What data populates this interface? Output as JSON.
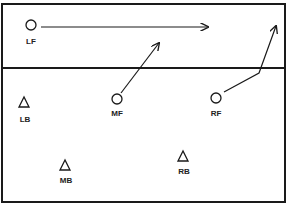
{
  "diagram": {
    "title": "",
    "colors": {
      "ink": "#1a1a1a",
      "background": "#ffffff"
    },
    "players": [
      {
        "id": "LF",
        "label": "LF",
        "shape": "circle-icon"
      },
      {
        "id": "MF",
        "label": "MF",
        "shape": "circle-icon"
      },
      {
        "id": "RF",
        "label": "RF",
        "shape": "circle-icon"
      },
      {
        "id": "LB",
        "label": "LB",
        "shape": "triangle-icon"
      },
      {
        "id": "MB",
        "label": "MB",
        "shape": "triangle-icon"
      },
      {
        "id": "RB",
        "label": "RB",
        "shape": "triangle-icon"
      }
    ],
    "movements": [
      {
        "from": "LF",
        "description": "LF runs straight right along the net zone"
      },
      {
        "from": "MF",
        "description": "MF moves diagonally up-right across the net line"
      },
      {
        "from": "RF",
        "description": "RF moves right to the net line then cuts up-right"
      }
    ]
  }
}
